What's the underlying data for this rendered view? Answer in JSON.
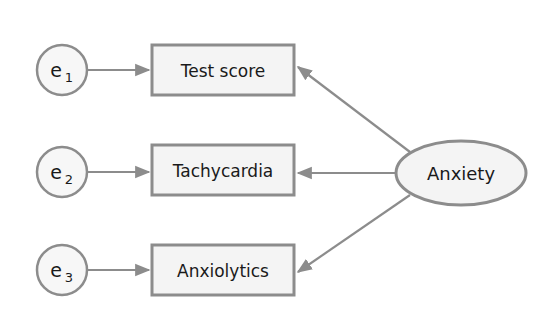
{
  "diagram": {
    "type": "structural-equation-model",
    "colors": {
      "stroke": "#8c8c8c",
      "fill": "#f4f4f4",
      "text": "#1a1a1a",
      "background": "#ffffff"
    },
    "latent": {
      "id": "anxiety",
      "label": "Anxiety"
    },
    "indicators": [
      {
        "id": "test-score",
        "label": "Test score",
        "error": {
          "base": "e",
          "sub": "1"
        }
      },
      {
        "id": "tachycardia",
        "label": "Tachycardia",
        "error": {
          "base": "e",
          "sub": "2"
        }
      },
      {
        "id": "anxiolytics",
        "label": "Anxiolytics",
        "error": {
          "base": "e",
          "sub": "3"
        }
      }
    ],
    "edges": [
      {
        "from": "e1",
        "to": "test-score"
      },
      {
        "from": "e2",
        "to": "tachycardia"
      },
      {
        "from": "e3",
        "to": "anxiolytics"
      },
      {
        "from": "anxiety",
        "to": "test-score"
      },
      {
        "from": "anxiety",
        "to": "tachycardia"
      },
      {
        "from": "anxiety",
        "to": "anxiolytics"
      }
    ]
  }
}
